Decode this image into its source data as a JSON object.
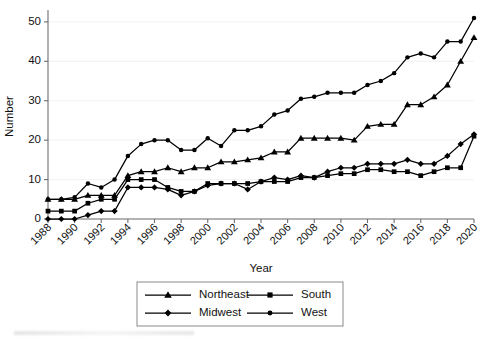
{
  "figure": {
    "title": "",
    "axes": {
      "ylabel": "Number",
      "xlabel": "Year",
      "ytick_labels": [
        "0",
        "10",
        "20",
        "30",
        "40",
        "50"
      ],
      "xtick_labels": [
        "1988",
        "1990",
        "1992",
        "1994",
        "1996",
        "1998",
        "2000",
        "2002",
        "2004",
        "2006",
        "2008",
        "2010",
        "2012",
        "2014",
        "2016",
        "2018",
        "2020"
      ]
    },
    "legend": {
      "position": "below-axes",
      "entries": [
        {
          "label": "Northeast",
          "marker": "triangle"
        },
        {
          "label": "South",
          "marker": "square"
        },
        {
          "label": "Midwest",
          "marker": "diamond"
        },
        {
          "label": "West",
          "marker": "circle"
        }
      ]
    }
  },
  "chart_data": {
    "type": "line",
    "title": "",
    "xlabel": "Year",
    "ylabel": "Number",
    "xlim": [
      1988,
      2020
    ],
    "ylim": [
      0,
      52
    ],
    "yticks": [
      0,
      10,
      20,
      30,
      40,
      50
    ],
    "xticks": [
      1988,
      1990,
      1992,
      1994,
      1996,
      1998,
      2000,
      2002,
      2004,
      2006,
      2008,
      2010,
      2012,
      2014,
      2016,
      2018,
      2020
    ],
    "grid": true,
    "legend_position": "bottom",
    "x": [
      1988,
      1989,
      1990,
      1991,
      1992,
      1993,
      1994,
      1995,
      1996,
      1997,
      1998,
      1999,
      2000,
      2001,
      2002,
      2003,
      2004,
      2005,
      2006,
      2007,
      2008,
      2009,
      2010,
      2011,
      2012,
      2013,
      2014,
      2015,
      2016,
      2017,
      2018,
      2019,
      2020
    ],
    "series": [
      {
        "name": "Northeast",
        "marker": "triangle",
        "color": "#000000",
        "values": [
          5,
          5,
          5,
          6,
          6,
          6,
          11,
          12,
          12,
          13,
          12,
          13,
          13,
          14.5,
          14.5,
          15,
          15.5,
          17,
          17,
          20.5,
          20.5,
          20.5,
          20.5,
          20,
          23.5,
          24,
          24,
          29,
          29,
          31,
          34,
          40,
          46
        ]
      },
      {
        "name": "South",
        "marker": "square",
        "color": "#000000",
        "values": [
          2,
          2,
          2,
          4,
          5,
          5,
          10,
          10,
          10,
          8,
          7,
          7,
          9,
          9,
          9,
          9,
          9.5,
          9.5,
          9.5,
          10.5,
          10.5,
          11,
          11.5,
          11.5,
          12.5,
          12.5,
          12,
          12,
          11,
          12,
          13,
          13,
          21
        ]
      },
      {
        "name": "Midwest",
        "marker": "diamond",
        "color": "#000000",
        "values": [
          0,
          0,
          0,
          1,
          2,
          2,
          8,
          8,
          8,
          7.5,
          6,
          7,
          8.5,
          9,
          9,
          7.5,
          9.5,
          10.5,
          10,
          11,
          10.5,
          12,
          13,
          13,
          14,
          14,
          14,
          15,
          14,
          14,
          16,
          19,
          21.5
        ]
      },
      {
        "name": "West",
        "marker": "circle",
        "color": "#000000",
        "values": [
          5,
          5,
          5.5,
          9,
          8,
          10,
          16,
          19,
          20,
          20,
          17.5,
          17.5,
          20.5,
          18.5,
          22.5,
          22.5,
          23.5,
          26.5,
          27.5,
          30.5,
          31,
          32,
          32,
          32,
          34,
          35,
          37,
          41,
          42,
          41,
          45,
          45,
          51
        ]
      }
    ]
  }
}
